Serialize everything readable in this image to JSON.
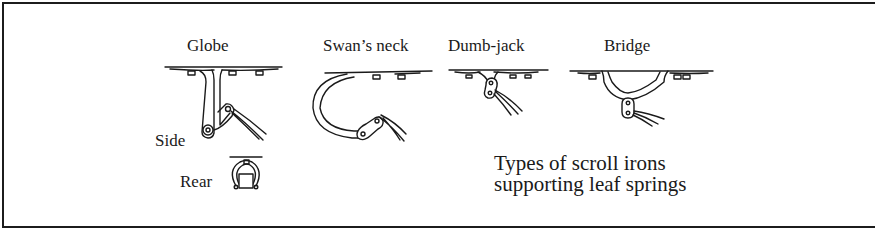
{
  "figure": {
    "caption_lines": [
      "Types of scroll irons",
      "supporting leaf springs"
    ],
    "types": [
      {
        "name": "Globe",
        "views": [
          "Side",
          "Rear"
        ]
      },
      {
        "name": "Swan’s neck"
      },
      {
        "name": "Dumb-jack"
      },
      {
        "name": "Bridge"
      }
    ],
    "colors": {
      "ink": "#1a1a1a",
      "paper": "#ffffff"
    }
  }
}
